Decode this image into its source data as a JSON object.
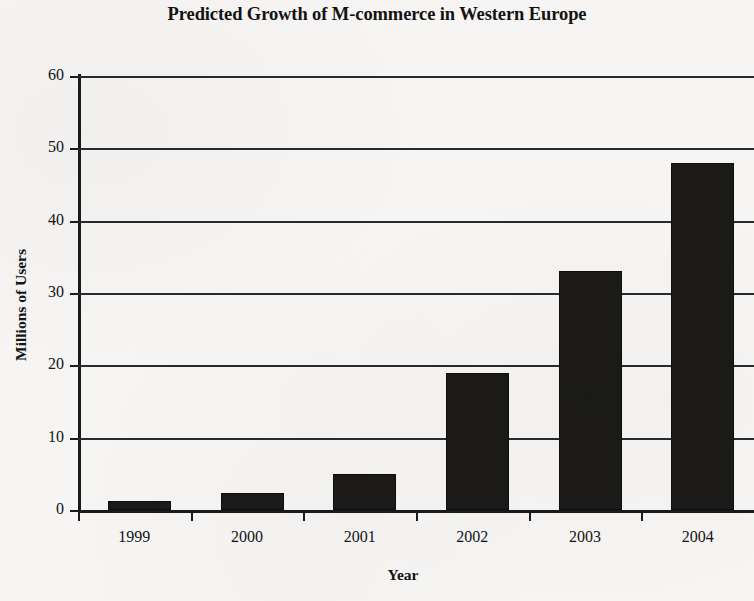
{
  "chart_data": {
    "type": "bar",
    "title": "Predicted Growth of M-commerce in Western Europe",
    "xlabel": "Year",
    "ylabel": "Millions of Users",
    "categories": [
      "1999",
      "2000",
      "2001",
      "2002",
      "2003",
      "2004"
    ],
    "values": [
      1.3,
      2.3,
      5.0,
      19.0,
      33.0,
      48.0
    ],
    "ylim": [
      0,
      60
    ],
    "yticks": [
      "0",
      "10",
      "20",
      "30",
      "40",
      "50",
      "60"
    ],
    "ytick_values": [
      0,
      10,
      20,
      30,
      40,
      50,
      60
    ],
    "grid": "horizontal",
    "legend": "none",
    "bar_color": "#1b1a18",
    "axis_color": "#1a1a1a",
    "background_color": "#f6f5f3",
    "series": [
      {
        "name": "Millions of Users",
        "values": [
          1.3,
          2.3,
          5.0,
          19.0,
          33.0,
          48.0
        ]
      }
    ]
  }
}
